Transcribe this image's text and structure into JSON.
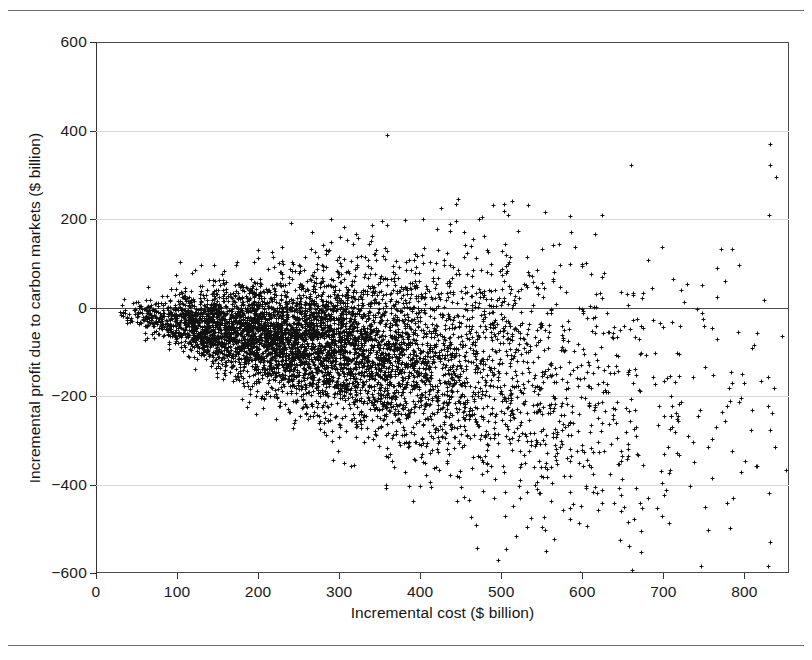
{
  "chart_data": {
    "type": "scatter",
    "title": "",
    "xlabel": "Incremental cost ($ billion)",
    "ylabel": "Incremental profit due to carbon markets ($ billion)",
    "xlim": [
      0,
      855
    ],
    "ylim": [
      -600,
      600
    ],
    "xticks": [
      0,
      100,
      200,
      300,
      400,
      500,
      600,
      700,
      800
    ],
    "xtick_labels": [
      "0",
      "100",
      "200",
      "300",
      "400",
      "500",
      "600",
      "700",
      "800"
    ],
    "yticks": [
      600,
      400,
      200,
      0,
      -200,
      -400,
      -600
    ],
    "ytick_labels": [
      "600",
      "400",
      "200",
      "0",
      "−200",
      "−400",
      "−600"
    ],
    "grid": "horizontal-only",
    "gridlines_y": [
      400,
      200,
      0,
      -200,
      -400
    ],
    "legend": "none",
    "marker": "plus",
    "marker_color": "#111111",
    "marker_size_px": 5,
    "n_points": 6000,
    "distribution": {
      "x_min": 0,
      "x_max": 855,
      "x_mode": 250,
      "x_shape": "right-skewed, peak near 200-300",
      "mean_slope": -0.33,
      "spread_slope": 0.42,
      "spread_intercept": 8,
      "upper_envelope_note": "Maximum profit ~545 at cost ~172; upper edge falls steadily beyond cost ~300",
      "lower_envelope_note": "Minimum profit ~-525 near cost ~800"
    },
    "extremes": {
      "highest_point": {
        "x": 172,
        "y": 545
      },
      "lowest_point": {
        "x": 800,
        "y": -525
      },
      "rightmost_point": {
        "x": 852,
        "y": -480
      },
      "zero_crossing_rightmost": {
        "x": 730,
        "y": 0
      }
    },
    "axis_line_color": "#4a4a4a",
    "gridline_color": "#d8d8d8",
    "background_color": "#ffffff"
  },
  "figure": {
    "top_rule": "",
    "bottom_rule": ""
  }
}
